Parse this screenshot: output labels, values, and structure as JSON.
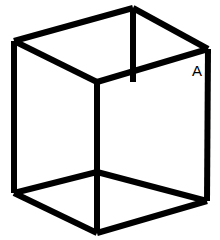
{
  "figure": {
    "type": "line-drawing",
    "background_color": "#ffffff",
    "stroke_color": "#000000",
    "stroke_width": 6,
    "canvas": {
      "width": 220,
      "height": 240
    },
    "labels": [
      {
        "id": "vertex-label-a",
        "text": "A",
        "x": 197,
        "y": 76,
        "font_size": 15,
        "color": "#000000"
      }
    ],
    "vertices": {
      "top_back_center": {
        "x": 133,
        "y": 8
      },
      "top_left": {
        "x": 14,
        "y": 41
      },
      "top_right": {
        "x": 208,
        "y": 49
      },
      "top_front_center": {
        "x": 97,
        "y": 82
      },
      "bottom_left": {
        "x": 14,
        "y": 193
      },
      "bottom_right": {
        "x": 207,
        "y": 201
      },
      "bottom_back_center": {
        "x": 97,
        "y": 172
      },
      "bottom_front_center": {
        "x": 97,
        "y": 233
      }
    },
    "edges": [
      {
        "id": "edge-top-left-to-apex",
        "name": "top-left-to-back-apex",
        "points": "14,41 133,8"
      },
      {
        "id": "edge-apex-to-top-right",
        "name": "back-apex-to-top-right",
        "points": "133,8 208,49"
      },
      {
        "id": "edge-top-left-to-center",
        "name": "top-left-to-front-top-center",
        "points": "14,41 97,82"
      },
      {
        "id": "edge-center-to-top-right",
        "name": "front-top-center-to-top-right",
        "points": "97,82 208,49"
      },
      {
        "id": "edge-vertical-left",
        "name": "left-vertical-edge",
        "points": "14,41 14,193"
      },
      {
        "id": "edge-vertical-right",
        "name": "right-vertical-edge",
        "points": "208,49 207,201"
      },
      {
        "id": "edge-vertical-center",
        "name": "center-vertical-edge",
        "points": "97,82 97,233"
      },
      {
        "id": "edge-vertical-back-apex",
        "name": "back-apex-vertical-edge",
        "points": "133,8 133,82"
      },
      {
        "id": "edge-bottom-left-to-center",
        "name": "bottom-left-to-back-bottom",
        "points": "14,193 97,172"
      },
      {
        "id": "edge-back-bottom-to-right",
        "name": "back-bottom-to-bottom-right",
        "points": "97,172 207,201"
      },
      {
        "id": "edge-bottom-left-to-front",
        "name": "bottom-left-to-front-bottom",
        "points": "14,193 97,233"
      },
      {
        "id": "edge-front-bottom-to-right",
        "name": "front-bottom-to-bottom-right",
        "points": "97,233 207,201"
      }
    ]
  }
}
